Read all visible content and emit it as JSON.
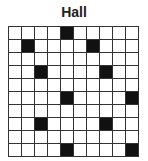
{
  "title": "Hall",
  "grid": {
    "rows": 10,
    "cols": 10,
    "filled": [
      [
        0,
        4
      ],
      [
        1,
        1
      ],
      [
        1,
        6
      ],
      [
        3,
        2
      ],
      [
        3,
        7
      ],
      [
        5,
        4
      ],
      [
        5,
        9
      ],
      [
        7,
        2
      ],
      [
        7,
        7
      ],
      [
        9,
        4
      ],
      [
        9,
        9
      ]
    ]
  }
}
